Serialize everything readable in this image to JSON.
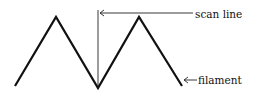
{
  "diagram": {
    "labels": {
      "scan_line": "scan line",
      "filament": "filament"
    },
    "colors": {
      "stroke": "#111111",
      "background": "#ffffff"
    },
    "filament_points": [
      [
        15,
        86
      ],
      [
        56,
        17
      ],
      [
        98,
        88
      ],
      [
        139,
        17
      ],
      [
        182,
        86
      ]
    ],
    "scan_line": {
      "x": 98,
      "y_top": 10,
      "y_bottom": 88
    }
  }
}
